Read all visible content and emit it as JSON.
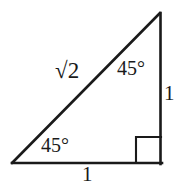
{
  "figure": {
    "kind": "right-triangle-diagram",
    "background_color": "#ffffff",
    "stroke_color": "#1a1a1a",
    "stroke_width": 2.6,
    "canvas": {
      "width": 175,
      "height": 187
    },
    "vertices": {
      "left": {
        "x": 12,
        "y": 163
      },
      "top_right": {
        "x": 160,
        "y": 13
      },
      "bottom_right": {
        "x": 161,
        "y": 163
      }
    },
    "right_angle_marker": {
      "name": "right-angle-square",
      "x": 136,
      "y": 137,
      "size": 25
    },
    "labels": {
      "hypotenuse": "2",
      "hypotenuse_radical": "√",
      "angle_top": "45°",
      "angle_bottom": "45°",
      "side_right": "1",
      "side_bottom": "1"
    }
  }
}
